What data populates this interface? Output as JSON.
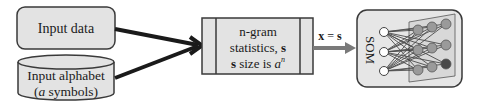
{
  "diagram": {
    "input_data": {
      "label": "Input data"
    },
    "input_alphabet": {
      "line1": "Input alphabet",
      "line2_italic": "a",
      "line2_rest": " symbols)",
      "line2_open": "("
    },
    "ngram": {
      "line1": "n-gram",
      "line2": "statistics, ",
      "line2_bold": "s",
      "line3_bold": "s",
      "line3": " size is ",
      "line3_italic": "a",
      "line3_sup": "n"
    },
    "edge_label": {
      "bold_x": "x",
      "eq": " = ",
      "bold_s": "s"
    },
    "som": {
      "label": "SOM"
    },
    "colors": {
      "box_fill": "#e3e3e3",
      "box_stroke": "#3a3a3a",
      "arrow_black": "#1a1a1a",
      "arrow_gray": "#7a7a7a",
      "node_input": "#ffffff",
      "node_output": "#9a9a9a",
      "node_dark": "#4a4a4a"
    }
  }
}
